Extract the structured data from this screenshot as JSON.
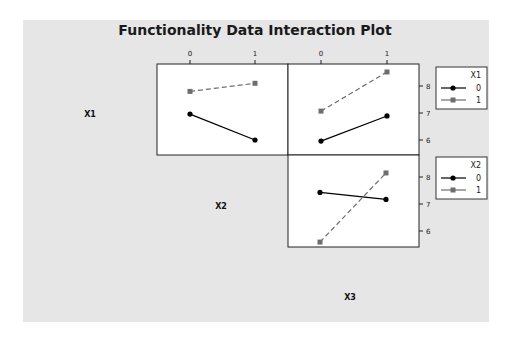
{
  "chart_data": {
    "type": "line",
    "title": "Functionality Data Interaction Plot",
    "factors": [
      "X1",
      "X2",
      "X3"
    ],
    "levels": [
      "0",
      "1"
    ],
    "yticks": [
      "6",
      "7",
      "8"
    ],
    "colors": {
      "background": "#e6e6e6",
      "panel": "#ffffff",
      "level0": "#000000",
      "level1": "#6e6e6e"
    },
    "panels": [
      {
        "name": "X1 by X2",
        "x_factor": "X2",
        "line_factor": "X1",
        "series": [
          {
            "name": "0",
            "values": [
              6.96,
              6.0
            ]
          },
          {
            "name": "1",
            "values": [
              7.8,
              8.1
            ]
          }
        ]
      },
      {
        "name": "X1 by X3",
        "x_factor": "X3",
        "line_factor": "X1",
        "series": [
          {
            "name": "0",
            "values": [
              5.96,
              6.89
            ]
          },
          {
            "name": "1",
            "values": [
              7.07,
              8.52
            ]
          }
        ]
      },
      {
        "name": "X2 by X3",
        "x_factor": "X3",
        "line_factor": "X2",
        "series": [
          {
            "name": "0",
            "values": [
              7.43,
              7.17
            ]
          },
          {
            "name": "1",
            "values": [
              5.59,
              8.15
            ]
          }
        ]
      }
    ],
    "legends": [
      {
        "title": "X1",
        "entries": [
          "0",
          "1"
        ]
      },
      {
        "title": "X2",
        "entries": [
          "0",
          "1"
        ]
      }
    ],
    "grid": false
  }
}
